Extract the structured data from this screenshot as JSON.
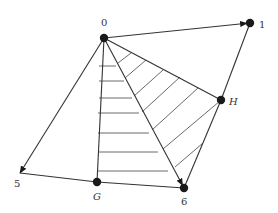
{
  "diagram": {
    "type": "directed-graph-with-hatched-regions",
    "nodes": [
      {
        "id": "0",
        "label": "0",
        "x": 104,
        "y": 38,
        "label_x": 101,
        "label_y": 26,
        "italic": false
      },
      {
        "id": "1",
        "label": "1",
        "x": 250,
        "y": 23,
        "label_x": 259,
        "label_y": 28,
        "italic": false
      },
      {
        "id": "H",
        "label": "H",
        "x": 221,
        "y": 100,
        "label_x": 229,
        "label_y": 105,
        "italic": true
      },
      {
        "id": "5",
        "label": "5",
        "x": 20,
        "y": 173,
        "label_x": 14,
        "label_y": 187,
        "italic": false
      },
      {
        "id": "G",
        "label": "G",
        "x": 97,
        "y": 182,
        "label_x": 93,
        "label_y": 200,
        "italic": true
      },
      {
        "id": "6",
        "label": "6",
        "x": 184,
        "y": 188,
        "label_x": 181,
        "label_y": 205,
        "italic": false
      }
    ],
    "edges": [
      {
        "from": "0",
        "to": "1",
        "directed": true
      },
      {
        "from": "0",
        "to": "5",
        "directed": true
      },
      {
        "from": "0",
        "to": "6",
        "directed": true
      },
      {
        "from": "0",
        "to": "G",
        "directed": false
      },
      {
        "from": "0",
        "to": "H",
        "directed": false
      },
      {
        "from": "H",
        "to": "1",
        "directed": false
      },
      {
        "from": "H",
        "to": "6",
        "directed": false
      },
      {
        "from": "5",
        "to": "G",
        "directed": false
      },
      {
        "from": "G",
        "to": "6",
        "directed": false
      }
    ],
    "hatched_regions": [
      {
        "name": "triangle-0-G-6",
        "pattern": "horizontal",
        "lines": [
          [
            99,
            66,
            116,
            66
          ],
          [
            99,
            81,
            124,
            81
          ],
          [
            99,
            98,
            132,
            98
          ],
          [
            98,
            113,
            139,
            113
          ],
          [
            98,
            133,
            149,
            133
          ],
          [
            98,
            152,
            158,
            152
          ],
          [
            98,
            171,
            168,
            171
          ]
        ]
      },
      {
        "name": "triangle-0-H-6",
        "pattern": "diagonal",
        "lines": [
          [
            118,
            63,
            131,
            53
          ],
          [
            125,
            78,
            146,
            60
          ],
          [
            134,
            96,
            163,
            70
          ],
          [
            142,
            112,
            180,
            77
          ],
          [
            152,
            130,
            198,
            88
          ],
          [
            163,
            149,
            220,
            101
          ],
          [
            175,
            167,
            203,
            143
          ]
        ]
      }
    ]
  }
}
